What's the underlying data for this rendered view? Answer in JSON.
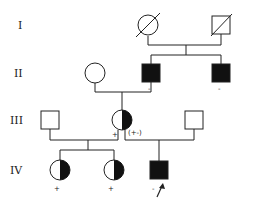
{
  "diagram": {
    "type": "pedigree",
    "generations": [
      {
        "label": "I",
        "y": 25
      },
      {
        "label": "II",
        "y": 73
      },
      {
        "label": "III",
        "y": 120
      },
      {
        "label": "IV",
        "y": 170
      }
    ],
    "individuals": [
      {
        "id": "I-1",
        "sex": "female",
        "status": "deceased",
        "affected": "none"
      },
      {
        "id": "I-2",
        "sex": "male",
        "status": "deceased",
        "affected": "none"
      },
      {
        "id": "II-1",
        "sex": "female",
        "affected": "none"
      },
      {
        "id": "II-2",
        "sex": "male",
        "affected": "full",
        "mark": "-"
      },
      {
        "id": "II-3",
        "sex": "male",
        "affected": "full",
        "mark": "-"
      },
      {
        "id": "III-1",
        "sex": "male",
        "affected": "none"
      },
      {
        "id": "III-2",
        "sex": "female",
        "affected": "half-carrier",
        "mark": "+",
        "annotation": "(+-)"
      },
      {
        "id": "III-3",
        "sex": "male",
        "affected": "none"
      },
      {
        "id": "IV-1",
        "sex": "female",
        "affected": "half-carrier",
        "mark": "+"
      },
      {
        "id": "IV-2",
        "sex": "female",
        "affected": "half-carrier",
        "mark": "+"
      },
      {
        "id": "IV-3",
        "sex": "male",
        "affected": "full",
        "mark": "-",
        "proband": true
      }
    ],
    "marks": {
      "II-2": "-",
      "II-3": "-",
      "III-2": "+",
      "III-2-note": "(+-)",
      "IV-1": "+",
      "IV-2": "+",
      "IV-3": "-"
    }
  }
}
